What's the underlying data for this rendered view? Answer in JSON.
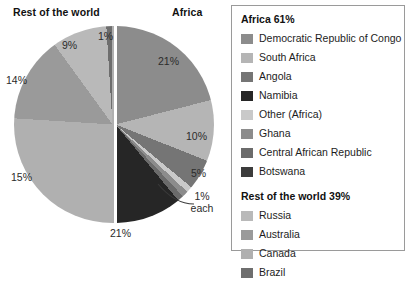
{
  "chart_data": {
    "type": "pie",
    "title": "",
    "subtitle": "",
    "xlabel": "",
    "ylabel": "",
    "grid": false,
    "legend_position": "right",
    "exploded": true,
    "groups": [
      {
        "name": "Africa",
        "total_label": "Africa 61%",
        "total_percent": 61,
        "side_label": "Africa",
        "slices": [
          {
            "label": "Democratic Republic of Congo",
            "value": 21,
            "value_label": "21%",
            "color": "#8c8c8c"
          },
          {
            "label": "South Africa",
            "value": 10,
            "value_label": "10%",
            "color": "#b5b5b5"
          },
          {
            "label": "Angola",
            "value": 5,
            "value_label": "5%",
            "color": "#757575"
          },
          {
            "label": "Other (Africa)",
            "value": 1,
            "value_label": "1% each",
            "color": "#c9c9c9"
          },
          {
            "label": "Ghana",
            "value": 1,
            "value_label": "1% each",
            "color": "#8c8c8c"
          },
          {
            "label": "Central African Republic",
            "value": 1,
            "value_label": "1% each",
            "color": "#6b6b6b"
          },
          {
            "label": "Botswana",
            "value": 21,
            "value_label": "21%",
            "color": "#2b2b2b"
          }
        ]
      },
      {
        "name": "Rest of the world",
        "total_label": "Rest of the world 39%",
        "total_percent": 39,
        "side_label": "Rest of the world",
        "slices": [
          {
            "label": "Russia",
            "value": 9,
            "value_label": "9%",
            "color": "#b9b9b9"
          },
          {
            "label": "Australia",
            "value": 14,
            "value_label": "14%",
            "color": "#9a9a9a"
          },
          {
            "label": "Canada",
            "value": 15,
            "value_label": "15%",
            "color": "#b0b0b0"
          },
          {
            "label": "Brazil",
            "value": 1,
            "value_label": "1%",
            "color": "#6e6e6e"
          }
        ]
      }
    ],
    "value_labels": [
      "21%",
      "10%",
      "5%",
      "1% each",
      "21%",
      "15%",
      "14%",
      "9%",
      "1%"
    ]
  },
  "chart": {
    "left_title": "Rest of the world",
    "right_title": "Africa",
    "labels": {
      "drc": "21%",
      "south_africa": "10%",
      "angola": "5%",
      "one_percent_each_line1": "1%",
      "one_percent_each_line2": "each",
      "botswana": "21%",
      "canada": "15%",
      "australia": "14%",
      "russia": "9%",
      "brazil": "1%"
    }
  },
  "legend": {
    "africa_title": "Africa 61%",
    "africa_items": [
      {
        "label": "Democratic Republic of Congo",
        "color": "#8c8c8c"
      },
      {
        "label": "South Africa",
        "color": "#b5b5b5"
      },
      {
        "label": "Angola",
        "color": "#757575"
      },
      {
        "label": "Namibia",
        "color": "#262626"
      },
      {
        "label": "Other (Africa)",
        "color": "#c9c9c9"
      },
      {
        "label": "Ghana",
        "color": "#8c8c8c"
      },
      {
        "label": "Central African Republic",
        "color": "#6b6b6b"
      },
      {
        "label": "Botswana",
        "color": "#3c3c3c"
      }
    ],
    "rotw_title": "Rest of the world 39%",
    "rotw_items": [
      {
        "label": "Russia",
        "color": "#b9b9b9"
      },
      {
        "label": "Australia",
        "color": "#9a9a9a"
      },
      {
        "label": "Canada",
        "color": "#b0b0b0"
      },
      {
        "label": "Brazil",
        "color": "#6e6e6e"
      }
    ]
  },
  "colors": {
    "border": "#9a9a9a",
    "text": "#1a1a1a",
    "background": "#ffffff"
  }
}
